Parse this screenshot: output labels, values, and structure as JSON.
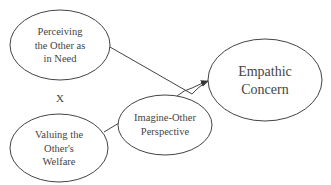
{
  "diagram": {
    "nodes": [
      {
        "id": "perceiving",
        "lines": [
          "Perceiving",
          "the Other as",
          "in Need"
        ]
      },
      {
        "id": "valuing",
        "lines": [
          "Valuing the",
          "Other's",
          "Welfare"
        ]
      },
      {
        "id": "imagine",
        "lines": [
          "Imagine-Other",
          "Perspective"
        ]
      },
      {
        "id": "empathic",
        "lines": [
          "Empathic",
          "Concern"
        ]
      }
    ],
    "operator": "X",
    "edges": [
      {
        "from": "perceiving",
        "to": "empathic",
        "arrow": true
      },
      {
        "from": "valuing",
        "to": "imagine",
        "arrow": false
      },
      {
        "from": "imagine",
        "to": "empathic",
        "arrow": true
      }
    ],
    "colors": {
      "stroke": "#444444",
      "text": "#444444",
      "background": "#ffffff"
    }
  }
}
